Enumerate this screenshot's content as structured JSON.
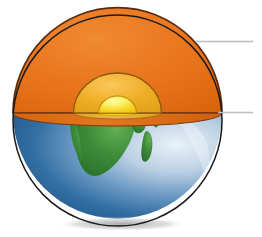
{
  "diagram": {
    "canvas": {
      "width": 262,
      "height": 237,
      "background": "#ffffff"
    },
    "globe": {
      "name": "earth-globe",
      "center_x": 117.5,
      "center_y": 120.5,
      "radius_x": 104.5,
      "radius_y": 105.5,
      "outline_color": "#1a1a1a",
      "outline_width": 1.6
    },
    "cut_plane": {
      "name": "cut-plane",
      "y": 113,
      "ellipse_center_x": 117.5,
      "ellipse_center_y": 113,
      "ellipse_radius_x": 104.5,
      "ellipse_radius_y": 13,
      "top_face_color": "#E2771E",
      "edge_color": "#7A3B12"
    },
    "layers": [
      {
        "id": "mantle",
        "name": "mantle-layer",
        "fill": "#E8741C",
        "highlight": "#F0record",
        "outline": "#5C2A0C",
        "radius_x": 104.5,
        "radius_y": 98,
        "depth_label": "outermost cutaway layer"
      },
      {
        "id": "outer-core",
        "name": "outer-core-layer",
        "fill": "#F0AE26",
        "highlight": "#F8CE63",
        "outline": "#8A5A10",
        "radius_x": 44,
        "radius_y": 40
      },
      {
        "id": "inner-core",
        "name": "inner-core-layer",
        "fill": "#F5D020",
        "highlight": "#FDF67F",
        "outline": "#B88A12",
        "radius_x": 19,
        "radius_y": 17
      }
    ],
    "surface": {
      "name": "earth-surface",
      "ocean_color": "#2E6A9E",
      "ocean_dark": "#1F4F7C",
      "ocean_light": "#CFDDEC",
      "land_color": "#3E8C3A",
      "land_dark": "#2E6D2B"
    },
    "leader_lines": [
      {
        "id": "leader-top",
        "name": "leader-line-top",
        "x1": 196,
        "y1": 41.5,
        "x2": 253,
        "y2": 41.5,
        "color": "#B9BCC2",
        "width": 1.4,
        "label": ""
      },
      {
        "id": "leader-bottom",
        "name": "leader-line-bottom",
        "x1": 218,
        "y1": 112.5,
        "x2": 253,
        "y2": 112.5,
        "color": "#B9BCC2",
        "width": 1.4,
        "label": ""
      }
    ],
    "shadow": {
      "name": "globe-shadow",
      "color": "#8E9296",
      "opacity": 0.55
    }
  }
}
